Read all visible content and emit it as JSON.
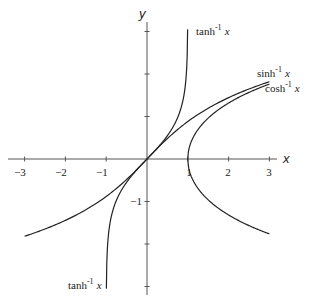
{
  "chart_data": {
    "type": "line",
    "title": "",
    "xlabel": "x",
    "ylabel": "y",
    "xlim": [
      -3,
      3
    ],
    "ylim": [
      -3,
      3
    ],
    "grid": false,
    "legend": "inline labels on curves",
    "x_ticks": [
      -3,
      -2,
      -1,
      1,
      2,
      3
    ],
    "x_tick_labels": [
      "−3",
      "−2",
      "−1",
      "1",
      "2",
      "3"
    ],
    "y_ticks": [
      -3,
      -2,
      -1,
      1,
      2,
      3
    ],
    "y_tick_labels": [
      "",
      "",
      "−1",
      "",
      "",
      ""
    ],
    "series": [
      {
        "name": "sinh⁻¹ x",
        "label_positions": [
          "upper right"
        ],
        "domain": [
          -3,
          3
        ],
        "x": [
          -3,
          -2,
          -1,
          0,
          1,
          2,
          3
        ],
        "values": [
          -1.818,
          -1.444,
          -0.881,
          0,
          0.881,
          1.444,
          1.818
        ]
      },
      {
        "name": "cosh⁻¹ x",
        "label_positions": [
          "upper right"
        ],
        "domain": [
          1,
          3
        ],
        "branches": "both (±)",
        "x": [
          1,
          1.5,
          2,
          2.5,
          3
        ],
        "values": [
          0,
          0.962,
          1.317,
          1.567,
          1.763
        ]
      },
      {
        "name": "tanh⁻¹ x",
        "label_positions": [
          "top",
          "bottom left"
        ],
        "domain": [
          -1,
          1
        ],
        "x": [
          -0.995,
          -0.9,
          -0.5,
          0,
          0.5,
          0.9,
          0.995
        ],
        "values": [
          -2.99,
          -1.472,
          -0.549,
          0,
          0.549,
          1.472,
          2.99
        ]
      }
    ]
  },
  "labels": {
    "x_axis": "x",
    "y_axis": "y",
    "tanh_top": "tanh",
    "tanh_bottom": "tanh",
    "sinh": "sinh",
    "cosh": "cosh",
    "inv_sup": "-1",
    "var": "x",
    "tick_xm3": "−3",
    "tick_xm2": "−2",
    "tick_xm1": "−1",
    "tick_x1": "1",
    "tick_x2": "2",
    "tick_x3": "3",
    "tick_ym1": "−1"
  }
}
